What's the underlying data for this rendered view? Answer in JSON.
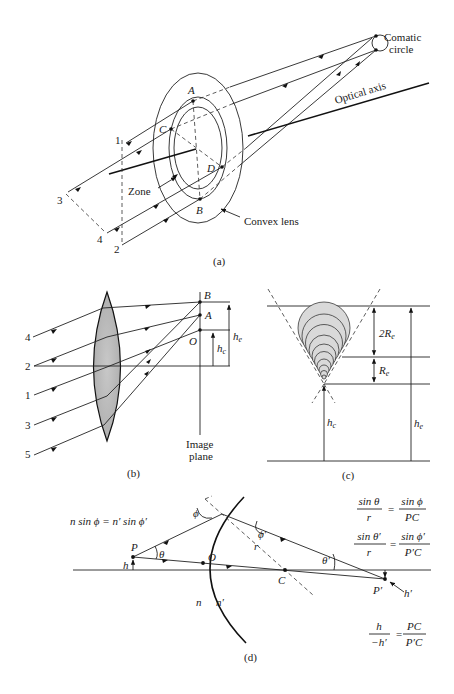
{
  "figure": {
    "panels": [
      {
        "id": "a",
        "caption": "(a)",
        "labels": {
          "comatic_circle_line1": "Comatic",
          "comatic_circle_line2": "circle",
          "optical_axis": "Optical axis",
          "zone": "Zone",
          "convex_lens": "Convex lens",
          "point_A": "A",
          "point_B": "B",
          "point_C": "C",
          "point_D": "D",
          "ray_1": "1",
          "ray_2": "2",
          "ray_3": "3",
          "ray_4": "4"
        }
      },
      {
        "id": "b",
        "caption": "(b)",
        "labels": {
          "ray_4": "4",
          "ray_2": "2",
          "ray_1": "1",
          "ray_3": "3",
          "ray_5": "5",
          "point_B": "B",
          "point_A": "A",
          "point_O": "O",
          "h_c": "h",
          "h_c_sub": "c",
          "h_e": "h",
          "h_e_sub": "e",
          "image_plane_line1": "Image",
          "image_plane_line2": "plane"
        }
      },
      {
        "id": "c",
        "caption": "(c)",
        "labels": {
          "two_R_e": "2R",
          "two_R_e_sub": "e",
          "R_e": "R",
          "R_e_sub": "e",
          "h_c": "h",
          "h_c_sub": "c",
          "h_e": "h",
          "h_e_sub": "e"
        }
      },
      {
        "id": "d",
        "caption": "(d)",
        "labels": {
          "point_P": "P",
          "point_O": "O",
          "point_C": "C",
          "point_P_prime": "P′",
          "h": "h",
          "h_prime": "h′",
          "theta": "θ",
          "theta_prime": "θ′",
          "phi": "ϕ",
          "phi_prime": "ϕ′",
          "r": "r",
          "n": "n",
          "n_prime": "n′"
        },
        "equations": {
          "snell": "n sin ϕ = n′ sin ϕ′",
          "eq1_num_left": "sin θ",
          "eq1_den_left": "r",
          "eq1_num_right": "sin ϕ",
          "eq1_den_right": "PC",
          "eq2_num_left": "sin θ′",
          "eq2_den_left": "r",
          "eq2_num_right": "sin ϕ′",
          "eq2_den_right": "P′C",
          "eq3_num_left": "h",
          "eq3_den_left": "−h′",
          "eq3_num_right": "PC",
          "eq3_den_right": "P′C",
          "equals": "="
        }
      }
    ]
  }
}
